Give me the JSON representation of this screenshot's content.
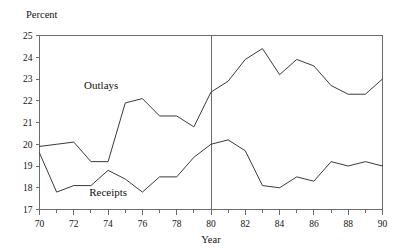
{
  "chart_data": {
    "type": "line",
    "title": "",
    "subtitle": "",
    "ylabel": "Percent",
    "xlabel": "Year",
    "x": [
      70,
      71,
      72,
      73,
      74,
      75,
      76,
      77,
      78,
      79,
      80,
      81,
      82,
      83,
      84,
      85,
      86,
      87,
      88,
      89,
      90
    ],
    "xlim": [
      70,
      90
    ],
    "ylim": [
      17,
      25
    ],
    "yticks": [
      17,
      18,
      19,
      20,
      21,
      22,
      23,
      24,
      25
    ],
    "xticks": [
      70,
      71,
      72,
      73,
      74,
      75,
      76,
      77,
      78,
      79,
      80,
      81,
      82,
      83,
      84,
      85,
      86,
      87,
      88,
      89,
      90
    ],
    "xtick_labels_shown": [
      "70",
      "72",
      "74",
      "76",
      "78",
      "80",
      "82",
      "84",
      "86",
      "88",
      "90"
    ],
    "ytick_labels_shown": [
      "17",
      "18",
      "19",
      "20",
      "21",
      "22",
      "23",
      "24",
      "25"
    ],
    "grid": false,
    "legend_position": "inline-annotation",
    "annotations": [
      {
        "name": "outlays-label",
        "text": "Outlays",
        "x": 72.6,
        "y": 22.55
      },
      {
        "name": "receipts-label",
        "text": "Receipts",
        "x": 72.9,
        "y": 17.6
      }
    ],
    "reference_lines": [
      {
        "name": "year-1980-divider",
        "orientation": "vertical",
        "x": 80
      }
    ],
    "series": [
      {
        "name": "Outlays",
        "color": "#3a3a3a",
        "values": [
          19.9,
          20.0,
          20.1,
          19.2,
          19.2,
          21.9,
          22.1,
          21.3,
          21.3,
          20.8,
          22.4,
          22.9,
          23.9,
          24.4,
          23.2,
          23.9,
          23.6,
          22.7,
          22.3,
          22.3,
          23.0
        ]
      },
      {
        "name": "Receipts",
        "color": "#3a3a3a",
        "values": [
          19.6,
          17.8,
          18.1,
          18.1,
          18.8,
          18.4,
          17.8,
          18.5,
          18.5,
          19.4,
          20.0,
          20.2,
          19.7,
          18.1,
          18.0,
          18.5,
          18.3,
          19.2,
          19.0,
          19.2,
          19.0
        ]
      }
    ]
  }
}
